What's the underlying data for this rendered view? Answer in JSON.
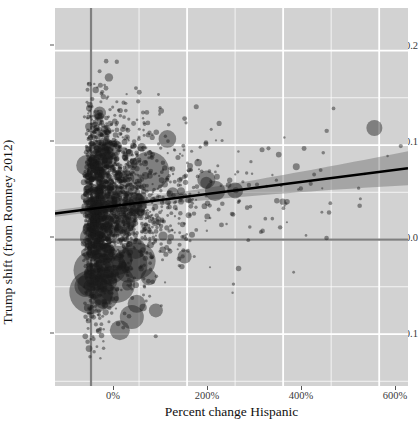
{
  "chart_data": {
    "type": "scatter",
    "title": "",
    "xlabel": "Percent change Hispanic",
    "ylabel": "Trump shift (from Romney 2012)",
    "xlim": [
      -75,
      660
    ],
    "ylim": [
      -0.155,
      0.245
    ],
    "xticks": [
      0,
      200,
      400,
      600
    ],
    "xticklabels": [
      "0%",
      "200%",
      "400%",
      "600%"
    ],
    "xminorticks": [
      -100,
      100,
      300,
      500
    ],
    "yticks": [
      -0.1,
      0.0,
      0.1,
      0.2
    ],
    "yticklabels": [
      "-0.1",
      "0.0",
      "0.1",
      "0.2"
    ],
    "yminorticks": [
      -0.15,
      -0.05,
      0.05,
      0.15
    ],
    "grid": true,
    "legend": null,
    "panel_background": "#d2d2d2",
    "gridline_color": "#ffffff",
    "point_color": "#1a1a1a",
    "point_opacity": 0.45,
    "point_size_encoding": "bubble area by population",
    "reference_lines": [
      {
        "name": "x-zero-line",
        "orientation": "vertical",
        "value": 0,
        "color": "#808080"
      },
      {
        "name": "y-zero-line",
        "orientation": "horizontal",
        "value": 0.0,
        "color": "#808080"
      }
    ],
    "trend_line": {
      "name": "linear-fit",
      "color": "#000000",
      "x_start": -75,
      "y_start": 0.0275,
      "x_end": 660,
      "y_end": 0.0755,
      "confidence_band": {
        "color": "#6e6e6e",
        "opacity": 0.45,
        "half_width_start": 0.0035,
        "half_width_end": 0.018
      }
    },
    "n_points_rendered": 2400
  },
  "axes": {
    "y_title": "Trump shift (from Romney 2012)",
    "x_title": "Percent change Hispanic"
  }
}
